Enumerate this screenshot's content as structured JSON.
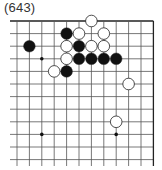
{
  "title": "(643)",
  "board": {
    "cols": 12,
    "rows": 12,
    "origin_x": 17,
    "origin_y": 21,
    "spacing_x": 12.4,
    "spacing_y": 12.6,
    "open_left": true,
    "open_bottom": true,
    "top_edge": true,
    "right_edge": true,
    "line_color": "#555555",
    "edge_color": "#222222",
    "hoshi": [
      [
        2,
        3
      ],
      [
        2,
        9
      ],
      [
        8,
        9
      ]
    ],
    "stones": [
      {
        "color": "white",
        "col": 6,
        "row": 0
      },
      {
        "color": "black",
        "col": 4,
        "row": 1
      },
      {
        "color": "white",
        "col": 5,
        "row": 1
      },
      {
        "color": "white",
        "col": 7,
        "row": 1
      },
      {
        "color": "black",
        "col": 1,
        "row": 2
      },
      {
        "color": "white",
        "col": 4,
        "row": 2
      },
      {
        "color": "black",
        "col": 5,
        "row": 2
      },
      {
        "color": "white",
        "col": 6,
        "row": 2
      },
      {
        "color": "white",
        "col": 7,
        "row": 2
      },
      {
        "color": "white",
        "col": 4,
        "row": 3
      },
      {
        "color": "black",
        "col": 5,
        "row": 3
      },
      {
        "color": "black",
        "col": 6,
        "row": 3
      },
      {
        "color": "black",
        "col": 7,
        "row": 3
      },
      {
        "color": "black",
        "col": 8,
        "row": 3
      },
      {
        "color": "white",
        "col": 3,
        "row": 4
      },
      {
        "color": "black",
        "col": 4,
        "row": 4
      },
      {
        "color": "white",
        "col": 9,
        "row": 5
      },
      {
        "color": "white",
        "col": 8,
        "row": 8
      }
    ]
  }
}
